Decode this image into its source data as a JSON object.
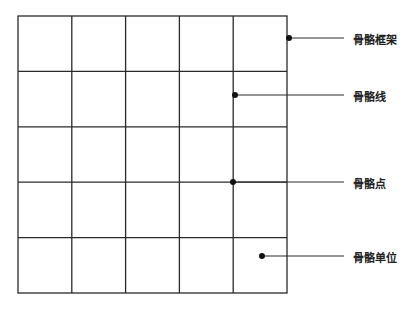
{
  "diagram": {
    "grid": {
      "rows": 5,
      "cols": 5,
      "left": 18,
      "top": 16,
      "right": 287,
      "bottom": 293,
      "stroke": "#2a2a2a"
    },
    "annotations": [
      {
        "id": "frame",
        "label": "骨骼框架",
        "dot": [
          289,
          38
        ],
        "line_end": [
          344,
          38
        ],
        "label_pos": [
          353,
          32
        ]
      },
      {
        "id": "line",
        "label": "骨骼线",
        "dot": [
          235,
          95
        ],
        "line_end": [
          344,
          95
        ],
        "label_pos": [
          353,
          89
        ]
      },
      {
        "id": "point",
        "label": "骨骼点",
        "dot": [
          233,
          182
        ],
        "line_end": [
          344,
          182
        ],
        "label_pos": [
          353,
          176
        ]
      },
      {
        "id": "unit",
        "label": "骨骼单位",
        "dot": [
          262,
          256
        ],
        "line_end": [
          344,
          256
        ],
        "label_pos": [
          353,
          250
        ]
      }
    ]
  }
}
